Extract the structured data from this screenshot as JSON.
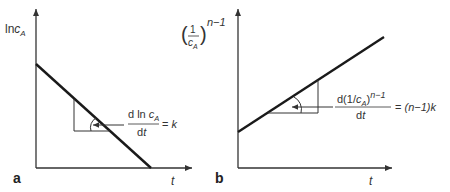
{
  "figure": {
    "panels": [
      {
        "id": "a",
        "letter": "a",
        "y_axis_label": {
          "base": "ln",
          "var": "c",
          "subscript": "A"
        },
        "x_axis_label": "t",
        "line": "decreasing",
        "slope_annotation": {
          "numerator_prefix": "d ln ",
          "numerator_var": "c",
          "numerator_subscript": "A",
          "denominator": "dt",
          "equals": "= ",
          "result": "k"
        }
      },
      {
        "id": "b",
        "letter": "b",
        "y_axis_label": {
          "open_paren": "(",
          "numerator": "1",
          "denominator_var": "c",
          "denominator_subscript": "A",
          "close_paren": ")",
          "exponent": "n−1"
        },
        "x_axis_label": "t",
        "line": "increasing",
        "slope_annotation": {
          "numerator_prefix": "d(1/",
          "numerator_var": "c",
          "numerator_subscript": "A",
          "numerator_suffix": ")",
          "numerator_exponent": "n−1",
          "denominator": "dt",
          "equals": "= ",
          "result": "(n−1)k"
        }
      }
    ],
    "colors": {
      "line": "#1a1a1a",
      "axis": "#333333",
      "text": "#333333"
    }
  }
}
